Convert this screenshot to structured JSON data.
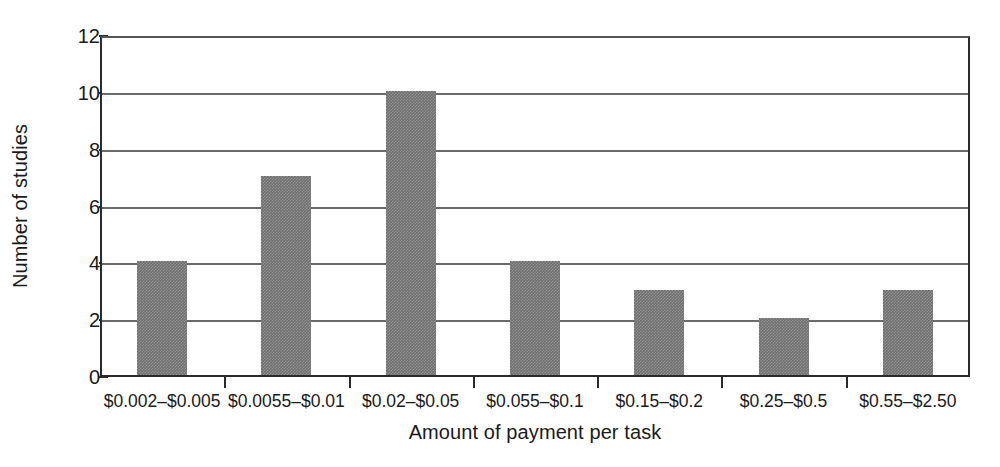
{
  "chart_data": {
    "type": "bar",
    "title": "",
    "xlabel": "Amount of payment per task",
    "ylabel": "Number of studies",
    "categories": [
      "$0.002–$0.005",
      "$0.0055–$0.01",
      "$0.02–$0.05",
      "$0.055–$0.1",
      "$0.15–$0.2",
      "$0.25–$0.5",
      "$0.55–$2.50"
    ],
    "values": [
      4,
      7,
      10,
      4,
      3,
      2,
      3
    ],
    "ylim": [
      0,
      12
    ],
    "ytick_labels": [
      "0",
      "2",
      "4",
      "6",
      "8",
      "10",
      "12"
    ],
    "ytick_values": [
      0,
      2,
      4,
      6,
      8,
      10,
      12
    ],
    "grid": "horizontal",
    "legend": "none",
    "bar_color": "#6f6f6f",
    "axis_color": "#2b2b2b",
    "gridline_color": "#6a6a6a",
    "background_color": "#ffffff"
  }
}
